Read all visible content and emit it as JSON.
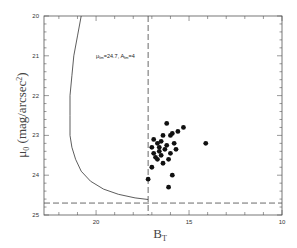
{
  "chart_data": {
    "type": "scatter",
    "title": "",
    "xlabel": "B_T",
    "ylabel": "μ_0 (mag/arcsec^2)",
    "xlim": [
      22.8,
      10
    ],
    "ylim": [
      25,
      20
    ],
    "x_inverted": true,
    "y_inverted": true,
    "xticks": [
      20,
      15,
      10
    ],
    "yticks": [
      20,
      21,
      22,
      23,
      24,
      25
    ],
    "grid": false,
    "legend": null,
    "annotations": [
      {
        "text": "μ_lim=24.7, A_lim=4",
        "x": 20.0,
        "y": 21.05
      }
    ],
    "reference_lines": [
      {
        "orientation": "vertical",
        "value": 17.2,
        "style": "dashed"
      },
      {
        "orientation": "horizontal",
        "value": 24.7,
        "style": "dashed"
      }
    ],
    "curve": {
      "name": "selection limit (μ_lim=24.7, A_lim=4)",
      "style": "solid",
      "points": [
        [
          20.8,
          20.0
        ],
        [
          21.0,
          20.5
        ],
        [
          21.2,
          21.0
        ],
        [
          21.3,
          21.5
        ],
        [
          21.4,
          22.0
        ],
        [
          21.4,
          22.5
        ],
        [
          21.4,
          23.0
        ],
        [
          21.3,
          23.3
        ],
        [
          21.1,
          23.6
        ],
        [
          20.8,
          23.9
        ],
        [
          20.3,
          24.15
        ],
        [
          19.6,
          24.35
        ],
        [
          18.8,
          24.48
        ],
        [
          17.9,
          24.57
        ],
        [
          17.2,
          24.61
        ]
      ]
    },
    "series": [
      {
        "name": "galaxies",
        "marker": "filled-circle",
        "points": [
          [
            16.2,
            22.7
          ],
          [
            15.3,
            22.8
          ],
          [
            15.6,
            22.9
          ],
          [
            15.9,
            22.95
          ],
          [
            14.1,
            23.2
          ],
          [
            16.4,
            23.0
          ],
          [
            16.0,
            23.0
          ],
          [
            16.9,
            23.1
          ],
          [
            16.7,
            23.2
          ],
          [
            16.5,
            23.15
          ],
          [
            16.2,
            23.25
          ],
          [
            15.8,
            23.2
          ],
          [
            17.0,
            23.3
          ],
          [
            16.6,
            23.3
          ],
          [
            16.3,
            23.35
          ],
          [
            15.7,
            23.35
          ],
          [
            16.5,
            23.5
          ],
          [
            16.0,
            23.45
          ],
          [
            16.7,
            23.6
          ],
          [
            16.1,
            23.6
          ],
          [
            16.4,
            23.7
          ],
          [
            16.8,
            23.55
          ],
          [
            17.0,
            23.8
          ],
          [
            15.9,
            24.0
          ],
          [
            17.2,
            24.1
          ],
          [
            16.1,
            24.3
          ],
          [
            16.6,
            23.4
          ],
          [
            16.9,
            23.45
          ]
        ]
      }
    ]
  }
}
